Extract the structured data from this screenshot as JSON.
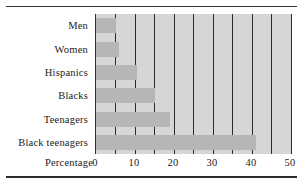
{
  "chart_data": {
    "type": "bar",
    "orientation": "horizontal",
    "title": "",
    "xlabel": "Percentage",
    "ylabel": "",
    "categories": [
      "Men",
      "Women",
      "Hispanics",
      "Blacks",
      "Teenagers",
      "Black teenagers"
    ],
    "values": [
      5,
      6,
      10.5,
      15,
      19,
      41
    ],
    "xlim": [
      0,
      50
    ],
    "xticks": [
      0,
      10,
      20,
      30,
      40,
      50
    ],
    "xticklabels": [
      "0",
      "10",
      "20",
      "30",
      "40",
      "50"
    ],
    "gridlines_at": [
      5,
      10,
      15,
      20,
      25,
      30,
      35,
      40,
      45,
      50
    ],
    "grid": true,
    "legend": null,
    "colors": {
      "bar": "#b6b6b6",
      "panel": "#d6d6d6",
      "gridline": "#2b2b2b",
      "text": "#1b1b1b"
    }
  },
  "axis": {
    "row_label": "Percentage"
  }
}
